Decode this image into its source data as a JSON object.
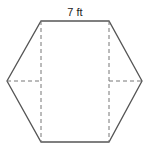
{
  "diagram": {
    "type": "hexagon-decomposition",
    "title": "",
    "top_side_label": "7 ft",
    "colors": {
      "outline": "#555555",
      "dashed": "#777777",
      "text": "#222222",
      "background": "#ffffff"
    },
    "vertices": {
      "top_left": [
        41,
        21
      ],
      "top_right": [
        109,
        21
      ],
      "right": [
        142,
        81
      ],
      "bottom_right": [
        109,
        142
      ],
      "bottom_left": [
        41,
        142
      ],
      "left": [
        7,
        81
      ]
    },
    "dashed_segments": [
      {
        "name": "left-vertical",
        "from": [
          41,
          21
        ],
        "to": [
          41,
          142
        ]
      },
      {
        "name": "right-vertical",
        "from": [
          109,
          21
        ],
        "to": [
          109,
          142
        ]
      },
      {
        "name": "left-horizontal",
        "from": [
          7,
          81
        ],
        "to": [
          41,
          81
        ]
      },
      {
        "name": "right-horizontal",
        "from": [
          109,
          81
        ],
        "to": [
          142,
          81
        ]
      }
    ]
  }
}
